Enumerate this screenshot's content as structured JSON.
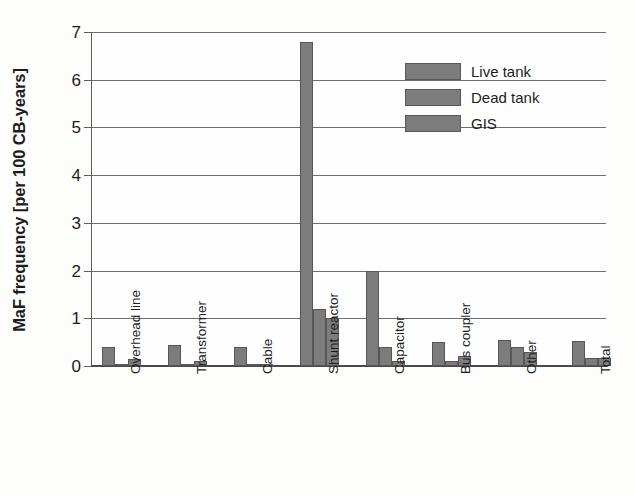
{
  "chart_data": {
    "type": "bar",
    "title": "",
    "subtitle": "",
    "xlabel": "",
    "ylabel": "MaF frequency [per 100 CB-years]",
    "ylim": [
      0,
      7
    ],
    "ytick_labels": [
      "0",
      "1",
      "2",
      "3",
      "4",
      "5",
      "6",
      "7"
    ],
    "ytick_values": [
      0,
      1,
      2,
      3,
      4,
      5,
      6,
      7
    ],
    "grid": true,
    "grid_axis": "y",
    "legend_position": "upper-right-inside",
    "categories": [
      "Overhead line",
      "Transformer",
      "Cable",
      "Shunt reactor",
      "Capacitor",
      "Bus coupler",
      "Other",
      "Total"
    ],
    "series": [
      {
        "name": "Live tank",
        "color": "#7c7c7c",
        "values": [
          0.4,
          0.45,
          0.4,
          6.8,
          2.0,
          0.5,
          0.55,
          0.53
        ]
      },
      {
        "name": "Dead tank",
        "color": "#7c7c7c",
        "values": [
          0.05,
          0.05,
          0.05,
          1.2,
          0.4,
          0.1,
          0.4,
          0.17
        ]
      },
      {
        "name": "GIS",
        "color": "#7c7c7c",
        "values": [
          0.15,
          0.1,
          0.05,
          1.0,
          0.1,
          0.2,
          0.3,
          0.17
        ]
      }
    ]
  },
  "legend": {
    "items": [
      {
        "label": "Live tank"
      },
      {
        "label": "Dead tank"
      },
      {
        "label": "GIS"
      }
    ]
  },
  "colors": {
    "bar_fill": "#7c7c7c",
    "bar_edge": "#575757",
    "gridline": "#6f6f6f",
    "axis": "#4a4a4a",
    "text": "#1c1c1c",
    "background": "#fdfdfc"
  }
}
